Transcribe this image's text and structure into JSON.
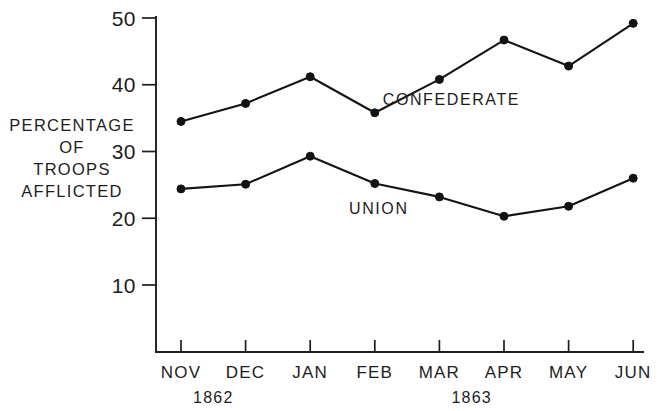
{
  "chart_data": {
    "type": "line",
    "title": "",
    "subtitle": "",
    "xlabel": "",
    "ylabel": "PERCENTAGE OF TROOPS AFFLICTED",
    "ylabel_lines": [
      "PERCENTAGE",
      "OF",
      "TROOPS",
      "AFFLICTED"
    ],
    "categories": [
      "NOV",
      "DEC",
      "JAN",
      "FEB",
      "MAR",
      "APR",
      "MAY",
      "JUN"
    ],
    "ytick_labels": [
      "10",
      "20",
      "30",
      "40",
      "50"
    ],
    "ytick_values": [
      10,
      20,
      30,
      40,
      50
    ],
    "ylim": [
      0,
      50
    ],
    "grid": false,
    "legend_position": "inline-labels",
    "series": [
      {
        "name": "CONFEDERATE",
        "label_x_category": "MAR",
        "values": [
          34.5,
          37.2,
          41.2,
          35.8,
          40.8,
          46.7,
          42.8,
          49.2
        ]
      },
      {
        "name": "UNION",
        "label_x_category": "FEB",
        "values": [
          24.4,
          25.1,
          29.3,
          25.2,
          23.2,
          20.3,
          21.8,
          26.0
        ]
      }
    ],
    "year_groups": [
      {
        "label": "1862",
        "spans": [
          "NOV",
          "DEC"
        ]
      },
      {
        "label": "1863",
        "spans": [
          "JAN",
          "FEB",
          "MAR",
          "APR",
          "MAY",
          "JUN"
        ]
      }
    ],
    "colors": {
      "line": "#141414",
      "marker": "#121212",
      "axis": "#1d1d1d",
      "background": "#ffffff",
      "text": "#1d1d1d"
    }
  },
  "annotations": {
    "confederate_label": "CONFEDERATE",
    "union_label": "UNION"
  }
}
